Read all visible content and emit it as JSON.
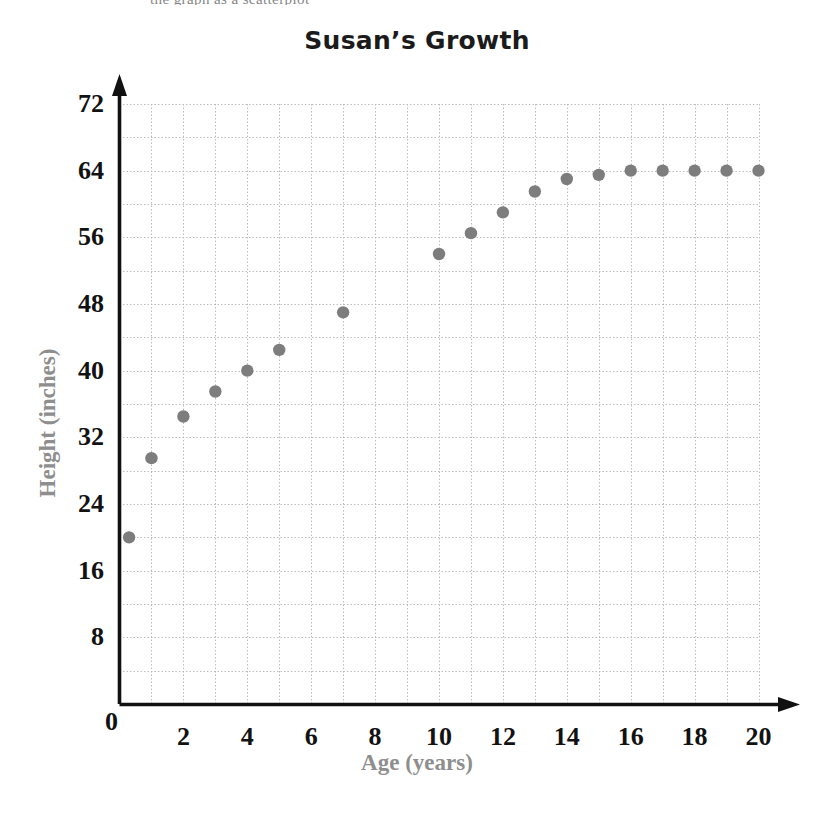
{
  "page": {
    "cut_off_header_text": "the graph as a scatterplot"
  },
  "chart": {
    "title": "Susan’s Growth",
    "xlabel": "Age (years)",
    "ylabel": "Height (inches)"
  },
  "axis": {
    "y_tick_labels": [
      "0",
      "8",
      "16",
      "24",
      "32",
      "40",
      "48",
      "56",
      "64",
      "72"
    ],
    "x_tick_labels": [
      "0",
      "2",
      "4",
      "6",
      "8",
      "10",
      "12",
      "14",
      "16",
      "18",
      "20"
    ]
  },
  "colors": {
    "point": "#7d7d7d",
    "axis": "#111111",
    "grid": "#b9b9b9",
    "axis_title": "#8e8e8e",
    "title": "#1b1b1b",
    "background": "#ffffff"
  },
  "chart_data": {
    "type": "scatter",
    "title": "Susan’s Growth",
    "xlabel": "Age (years)",
    "ylabel": "Height (inches)",
    "xlim": [
      0,
      20
    ],
    "ylim": [
      0,
      72
    ],
    "x_major_tick_step": 2,
    "x_grid_step": 1,
    "y_major_tick_step": 8,
    "y_grid_step": 4,
    "grid": true,
    "legend": "none",
    "series": [
      {
        "name": "Susan's height",
        "points": [
          {
            "x": 0.3,
            "y": 20
          },
          {
            "x": 1,
            "y": 29.5
          },
          {
            "x": 2,
            "y": 34.5
          },
          {
            "x": 3,
            "y": 37.5
          },
          {
            "x": 4,
            "y": 40
          },
          {
            "x": 5,
            "y": 42.5
          },
          {
            "x": 7,
            "y": 47
          },
          {
            "x": 10,
            "y": 54
          },
          {
            "x": 11,
            "y": 56.5
          },
          {
            "x": 12,
            "y": 59
          },
          {
            "x": 13,
            "y": 61.5
          },
          {
            "x": 14,
            "y": 63
          },
          {
            "x": 15,
            "y": 63.5
          },
          {
            "x": 16,
            "y": 64
          },
          {
            "x": 17,
            "y": 64
          },
          {
            "x": 18,
            "y": 64
          },
          {
            "x": 19,
            "y": 64
          },
          {
            "x": 20,
            "y": 64
          }
        ]
      }
    ]
  }
}
